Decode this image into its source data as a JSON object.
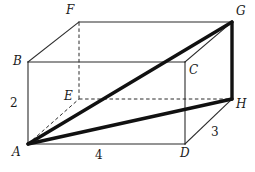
{
  "figure": {
    "type": "geometry-diagram",
    "shape": "rectangular-prism",
    "width": 255,
    "height": 172,
    "background_color": "#ffffff",
    "line_color": "#2b2b2b",
    "thick_line_color": "#111111",
    "vertices": [
      {
        "id": "A",
        "label": "A",
        "x": 28,
        "y": 144,
        "label_x": 12,
        "label_y": 146
      },
      {
        "id": "B",
        "label": "B",
        "x": 28,
        "y": 62,
        "label_x": 13,
        "label_y": 55
      },
      {
        "id": "C",
        "label": "C",
        "x": 185,
        "y": 62,
        "label_x": 189,
        "label_y": 64
      },
      {
        "id": "D",
        "label": "D",
        "x": 185,
        "y": 144,
        "label_x": 180,
        "label_y": 147
      },
      {
        "id": "E",
        "label": "E",
        "x": 79,
        "y": 99,
        "label_x": 64,
        "label_y": 90
      },
      {
        "id": "F",
        "label": "F",
        "x": 79,
        "y": 22,
        "label_x": 66,
        "label_y": 4
      },
      {
        "id": "G",
        "label": "G",
        "x": 232,
        "y": 22,
        "label_x": 236,
        "label_y": 5
      },
      {
        "id": "H",
        "label": "H",
        "x": 232,
        "y": 99,
        "label_x": 236,
        "label_y": 98
      }
    ],
    "edges_solid": [
      {
        "name": "edge-A-B",
        "from": "A",
        "to": "B"
      },
      {
        "name": "edge-B-C",
        "from": "B",
        "to": "C"
      },
      {
        "name": "edge-C-D",
        "from": "C",
        "to": "D"
      },
      {
        "name": "edge-A-D",
        "from": "A",
        "to": "D"
      },
      {
        "name": "edge-B-F",
        "from": "B",
        "to": "F"
      },
      {
        "name": "edge-F-G",
        "from": "F",
        "to": "G"
      },
      {
        "name": "edge-C-G",
        "from": "C",
        "to": "G"
      },
      {
        "name": "edge-D-H",
        "from": "D",
        "to": "H"
      }
    ],
    "edges_dashed": [
      {
        "name": "edge-E-F",
        "from": "E",
        "to": "F"
      },
      {
        "name": "edge-E-H",
        "from": "E",
        "to": "H"
      },
      {
        "name": "edge-A-E",
        "from": "A",
        "to": "E"
      }
    ],
    "edges_thick": [
      {
        "name": "diagonal-A-G",
        "from": "A",
        "to": "G"
      },
      {
        "name": "segment-A-H",
        "from": "A",
        "to": "H"
      },
      {
        "name": "edge-G-H",
        "from": "G",
        "to": "H"
      }
    ],
    "dimensions": [
      {
        "id": "height",
        "name": "dimension-label-height",
        "value": "2",
        "x": 10,
        "y": 97,
        "edge": "A-B"
      },
      {
        "id": "width",
        "name": "dimension-label-width",
        "value": "4",
        "x": 95,
        "y": 149,
        "edge": "A-D"
      },
      {
        "id": "depth",
        "name": "dimension-label-depth",
        "value": "3",
        "x": 211,
        "y": 126,
        "edge": "D-H"
      }
    ]
  }
}
